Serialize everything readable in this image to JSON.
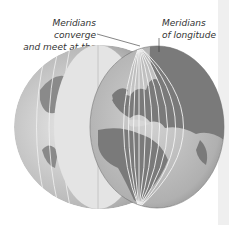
{
  "labels": {
    "converge_line1": "Meridians converge",
    "converge_line2": "and meet at the Poles",
    "longitude_line1": "Meridians",
    "longitude_line2": "of longitude"
  },
  "colors": {
    "land": "#7a7a7a",
    "ocean": "#d6d6d6",
    "cut_face": "#e4e4e4",
    "meridian": "#f4f4f4",
    "text": "#333333"
  }
}
